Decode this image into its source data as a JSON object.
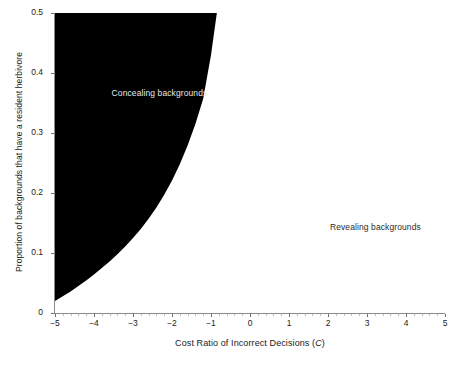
{
  "chart_data": {
    "type": "area",
    "title": "",
    "subtitle": "",
    "xlabel": "Cost Ratio of Incorrect Decisions (C)",
    "xlabel_symbol": "C",
    "ylabel": "Proportion of backgrounds that have a resident herbivore",
    "xlim": [
      -5,
      5
    ],
    "ylim": [
      0,
      0.5
    ],
    "grid": false,
    "legend_position": "none",
    "x_ticks": [
      -5,
      -4,
      -3,
      -2,
      -1,
      0,
      1,
      2,
      3,
      4,
      5
    ],
    "x_tick_labels": [
      "−5",
      "−4",
      "−3",
      "−2",
      "−1",
      "0",
      "1",
      "2",
      "3",
      "4",
      "5"
    ],
    "y_ticks": [
      0,
      0.1,
      0.2,
      0.3,
      0.4,
      0.5
    ],
    "y_tick_labels": [
      "0",
      "0.1",
      "0.2",
      "0.3",
      "0.4",
      "0.5"
    ],
    "x_minor_tick_step": 0.2,
    "shaded_region_color": "#000000",
    "background_color": "#ffffff",
    "boundary_curve_note": "Convex boundary separating concealing (left/above) from revealing (right/below) backgrounds",
    "boundary_curve": {
      "x": [
        -5.0,
        -4.8,
        -4.6,
        -4.4,
        -4.2,
        -4.0,
        -3.8,
        -3.6,
        -3.4,
        -3.2,
        -3.0,
        -2.8,
        -2.6,
        -2.4,
        -2.2,
        -2.0,
        -1.8,
        -1.6,
        -1.4,
        -1.2,
        -1.0,
        -0.85
      ],
      "y": [
        0.02,
        0.028,
        0.036,
        0.045,
        0.054,
        0.064,
        0.075,
        0.086,
        0.098,
        0.111,
        0.125,
        0.14,
        0.157,
        0.176,
        0.197,
        0.221,
        0.248,
        0.279,
        0.315,
        0.357,
        0.43,
        0.5
      ]
    },
    "annotations": [
      {
        "name": "concealing-backgrounds-label",
        "text": "Concealing backgrounds",
        "x": -3.55,
        "y": 0.365,
        "color": "#e8e8e8"
      },
      {
        "name": "revealing-backgrounds-label",
        "text": "Revealing backgrounds",
        "x": 2.05,
        "y": 0.142,
        "color": "#2a2a2a"
      }
    ],
    "series": [
      {
        "name": "Concealing backgrounds region",
        "fill": "#000000",
        "description": "Filled area left of and above the boundary curve"
      },
      {
        "name": "Revealing backgrounds region",
        "fill": "#ffffff",
        "description": "Unfilled area right of and below the boundary curve"
      }
    ]
  }
}
